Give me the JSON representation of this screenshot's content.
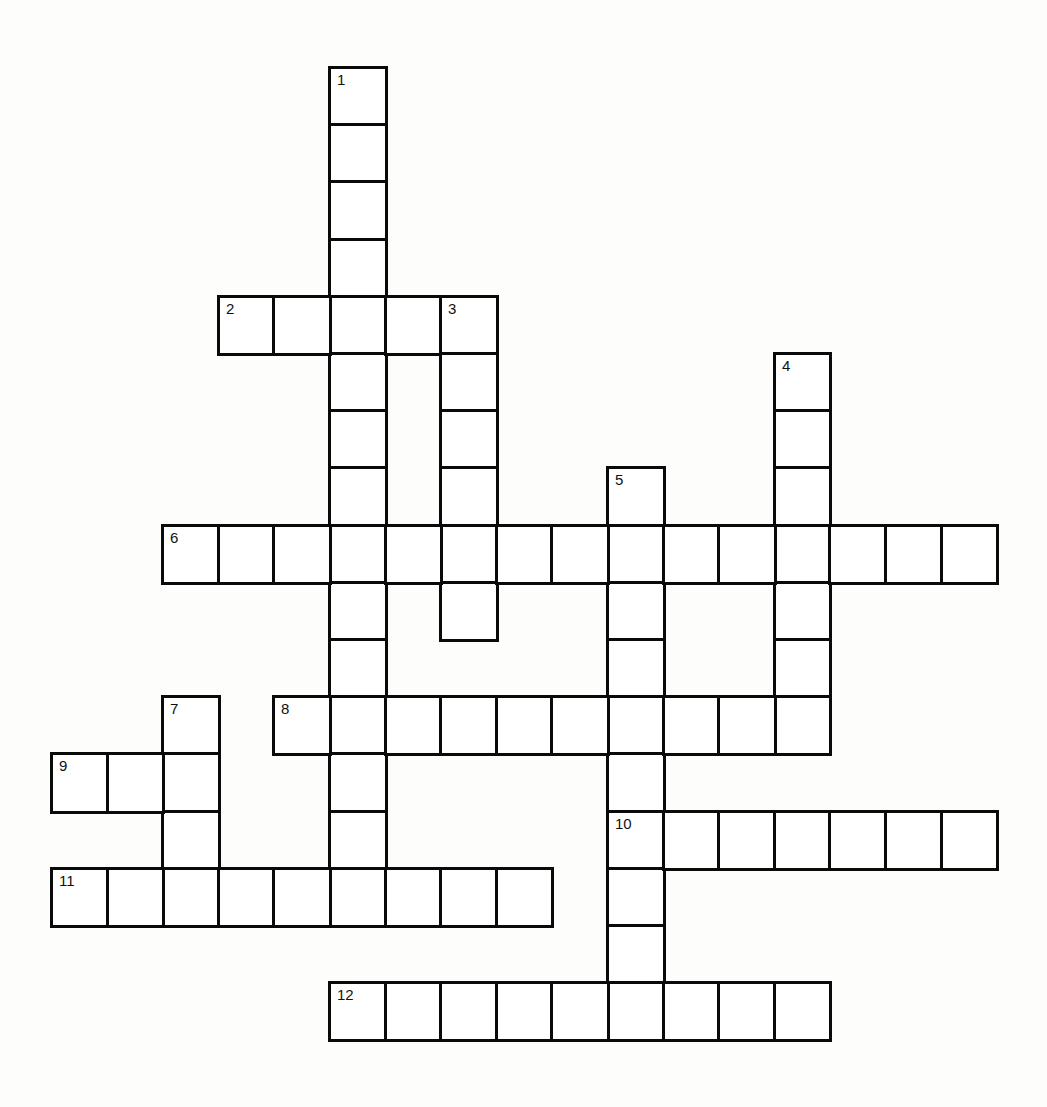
{
  "puzzle": {
    "type": "crossword",
    "grid": {
      "origin_x": 52,
      "origin_y": 68,
      "cell_w": 55.6,
      "cell_h": 57.2,
      "cols": 17,
      "rows": 17
    },
    "colors": {
      "background": "#fdfdfc",
      "cell_fill": "#ffffff",
      "border": "#0a0a0a"
    },
    "entries": [
      {
        "number": "1",
        "direction": "down",
        "row": 0,
        "col": 5,
        "length": 15
      },
      {
        "number": "2",
        "direction": "across",
        "row": 4,
        "col": 3,
        "length": 5
      },
      {
        "number": "3",
        "direction": "down",
        "row": 4,
        "col": 7,
        "length": 6
      },
      {
        "number": "4",
        "direction": "down",
        "row": 5,
        "col": 13,
        "length": 7
      },
      {
        "number": "5",
        "direction": "down",
        "row": 7,
        "col": 10,
        "length": 10
      },
      {
        "number": "6",
        "direction": "across",
        "row": 8,
        "col": 2,
        "length": 15
      },
      {
        "number": "7",
        "direction": "down",
        "row": 11,
        "col": 2,
        "length": 4
      },
      {
        "number": "8",
        "direction": "across",
        "row": 11,
        "col": 4,
        "length": 10
      },
      {
        "number": "9",
        "direction": "across",
        "row": 12,
        "col": 0,
        "length": 3
      },
      {
        "number": "10",
        "direction": "across",
        "row": 13,
        "col": 10,
        "length": 7
      },
      {
        "number": "11",
        "direction": "across",
        "row": 14,
        "col": 0,
        "length": 9
      },
      {
        "number": "12",
        "direction": "across",
        "row": 16,
        "col": 5,
        "length": 9
      }
    ]
  }
}
